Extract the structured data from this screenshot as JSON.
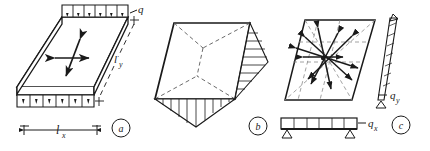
{
  "figure": {
    "background_color": "#ffffff",
    "ink_color": "#1a1a1a",
    "dashed_color": "#8a8a8a"
  },
  "panels": [
    {
      "id": "a",
      "tag": "a",
      "caption_tag": "a",
      "description": "Isometric slab with uniformly distributed load on edges and central orthogonal double arrows",
      "labels": {
        "load": "q",
        "span_y": "l_y",
        "span_x": "l_x",
        "span_y_main": "l",
        "span_y_sub": "y",
        "span_x_main": "l",
        "span_x_sub": "x"
      },
      "load_arrow_count_top": 6,
      "load_arrow_count_bottom": 6
    },
    {
      "id": "b",
      "tag": "b",
      "caption_tag": "b",
      "description": "Yield-line collapse mechanism of slab with hatched deflection diagrams along right and bottom edges",
      "labels": {}
    },
    {
      "id": "c",
      "tag": "c",
      "caption_tag": "c",
      "description": "Slab with radiating moment vectors and equivalent strip beams loaded by qx and qy",
      "labels": {
        "load_y": "q_y",
        "load_y_main": "q",
        "load_y_sub": "y",
        "load_x": "q_x",
        "load_x_main": "q",
        "load_x_sub": "x"
      },
      "beam_load_segments": 6
    }
  ]
}
